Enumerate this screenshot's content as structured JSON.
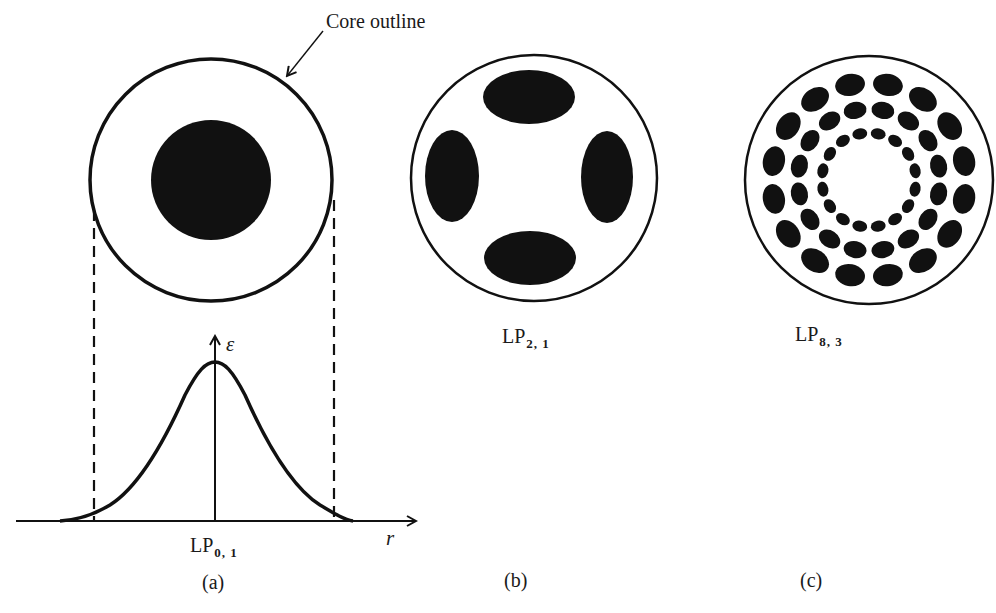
{
  "annotation": {
    "core_outline_label": "Core outline"
  },
  "panels": [
    {
      "id": "a",
      "caption": "(a)",
      "mode_base": "LP",
      "mode_sub": "0, 1",
      "pattern": "single central disk",
      "has_profile_plot": true
    },
    {
      "id": "b",
      "caption": "(b)",
      "mode_base": "LP",
      "mode_sub": "2, 1",
      "pattern": "4 lobes (top, bottom, left, right)"
    },
    {
      "id": "c",
      "caption": "(c)",
      "mode_base": "LP",
      "mode_sub": "8, 3",
      "pattern": "3 concentric rings of 16 lobes each"
    }
  ],
  "profile_plot": {
    "y_axis_label": "ε",
    "x_axis_label": "r",
    "curve": "bell-shaped field amplitude centered on axis",
    "dashed_lines": "project core boundary onto r axis"
  },
  "colors": {
    "ink": "#111111",
    "background": "#ffffff"
  }
}
